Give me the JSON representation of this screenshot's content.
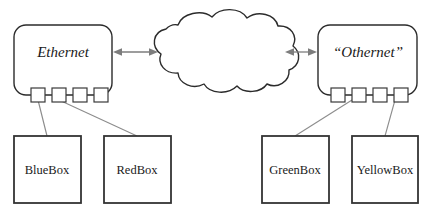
{
  "canvas": {
    "width": 430,
    "height": 216,
    "background": "#ffffff"
  },
  "colors": {
    "outline": "#2b2b2b",
    "host_outline": "#333333",
    "link": "#8c8c8c",
    "arrow": "#7d7d7d",
    "text": "#1a1a1a",
    "fill": "#ffffff"
  },
  "networks": [
    {
      "id": "ethernet",
      "label": "Ethernet",
      "style": "italic",
      "ports": 4,
      "port_labels": [
        "port-1",
        "port-2",
        "port-3",
        "port-4"
      ]
    },
    {
      "id": "othernet",
      "label": "“Othernet”",
      "style": "italic",
      "ports": 4,
      "port_labels": [
        "port-1",
        "port-2",
        "port-3",
        "port-4"
      ]
    }
  ],
  "cloud": {
    "id": "internet-cloud",
    "label": ""
  },
  "hosts": [
    {
      "id": "bluebox",
      "label": "BlueBox",
      "network": "ethernet",
      "port": 2
    },
    {
      "id": "redbox",
      "label": "RedBox",
      "network": "ethernet",
      "port": 1
    },
    {
      "id": "greenbox",
      "label": "GreenBox",
      "network": "othernet",
      "port": 2
    },
    {
      "id": "yellowbox",
      "label": "YellowBox",
      "network": "othernet",
      "port": 4
    }
  ],
  "connectors": [
    {
      "id": "ethernet-to-cloud",
      "from": "ethernet",
      "to": "internet-cloud",
      "type": "double-arrow"
    },
    {
      "id": "cloud-to-othernet",
      "from": "internet-cloud",
      "to": "othernet",
      "type": "double-arrow"
    }
  ]
}
